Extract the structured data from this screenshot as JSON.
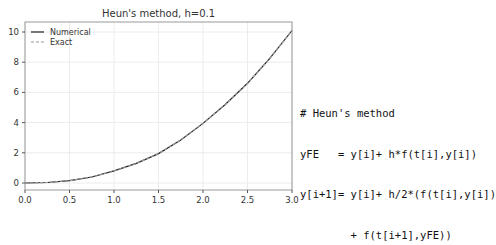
{
  "chart_data": {
    "type": "line",
    "title": "Heun's method, h=0.1",
    "xlabel": "",
    "ylabel": "",
    "xlim": [
      0.0,
      3.0
    ],
    "ylim": [
      -0.5,
      10.6
    ],
    "xticks": [
      "0.0",
      "0.5",
      "1.0",
      "1.5",
      "2.0",
      "2.5",
      "3.0"
    ],
    "xtick_values": [
      0.0,
      0.5,
      1.0,
      1.5,
      2.0,
      2.5,
      3.0
    ],
    "yticks": [
      "0",
      "2",
      "4",
      "6",
      "8",
      "10"
    ],
    "ytick_values": [
      0,
      2,
      4,
      6,
      8,
      10
    ],
    "grid": true,
    "legend_position": "upper left",
    "series": [
      {
        "name": "Numerical",
        "style": "solid",
        "color": "#222222",
        "x": [
          0.0,
          0.25,
          0.5,
          0.75,
          1.0,
          1.25,
          1.5,
          1.75,
          2.0,
          2.25,
          2.5,
          2.75,
          3.0
        ],
        "values": [
          0.0,
          0.03,
          0.15,
          0.4,
          0.8,
          1.3,
          1.95,
          2.85,
          3.95,
          5.2,
          6.6,
          8.25,
          10.1
        ]
      },
      {
        "name": "Exact",
        "style": "dashed",
        "color": "#999999",
        "x": [
          0.0,
          0.25,
          0.5,
          0.75,
          1.0,
          1.25,
          1.5,
          1.75,
          2.0,
          2.25,
          2.5,
          2.75,
          3.0
        ],
        "values": [
          0.0,
          0.03,
          0.15,
          0.4,
          0.8,
          1.3,
          1.95,
          2.85,
          3.95,
          5.2,
          6.6,
          8.25,
          10.1
        ]
      }
    ]
  },
  "code": {
    "lines": [
      "# Heun's method",
      "yFE   = y[i]+ h*f(t[i],y[i])",
      "y[i+1]= y[i]+ h/2*(f(t[i],y[i])",
      "        + f(t[i+1],yFE))"
    ]
  }
}
